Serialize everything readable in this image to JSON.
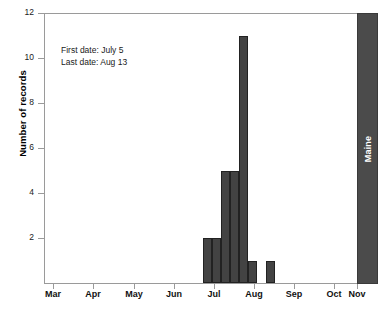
{
  "chart_data": {
    "type": "bar",
    "title": "",
    "subtitle": "",
    "xlabel": "",
    "ylabel": "Number of records",
    "ylim": [
      0,
      12
    ],
    "yticks": [
      2,
      4,
      6,
      8,
      10,
      12
    ],
    "ytick_labels": [
      "2",
      "4",
      "6",
      "8",
      "10",
      "12"
    ],
    "xtick_labels": [
      "Mar",
      "Apr",
      "May",
      "Jun",
      "Jul",
      "Aug",
      "Sep",
      "Oct",
      "Nov"
    ],
    "xtick_positions_px": [
      53,
      93,
      134,
      174,
      214,
      254,
      294,
      334,
      357
    ],
    "grid": false,
    "legend": null,
    "panel_label": "Maine",
    "bar_color": "#434343",
    "axis_color": "#9a9a9a",
    "categories": [
      "Jul 1",
      "Jul 7",
      "Jul 13",
      "Jul 19",
      "Jul 25",
      "Aug 1",
      "Aug 7",
      "Aug 13"
    ],
    "values": [
      2,
      2,
      5,
      5,
      11,
      1,
      0,
      1
    ],
    "bars": [
      {
        "label": "Jul 1",
        "value": 2,
        "left_px": 158,
        "width_px": 9
      },
      {
        "label": "Jul 7",
        "value": 2,
        "left_px": 167,
        "width_px": 9
      },
      {
        "label": "Jul 13",
        "value": 5,
        "left_px": 176,
        "width_px": 9
      },
      {
        "label": "Jul 19",
        "value": 5,
        "left_px": 185,
        "width_px": 9
      },
      {
        "label": "Jul 25",
        "value": 11,
        "left_px": 194,
        "width_px": 9
      },
      {
        "label": "Aug 1",
        "value": 1,
        "left_px": 203,
        "width_px": 9
      },
      {
        "label": "Aug 13",
        "value": 1,
        "left_px": 221,
        "width_px": 9
      }
    ],
    "annotations": [
      "First date: July 5",
      "Last date: Aug 13"
    ]
  },
  "annotation": {
    "first_date_line": "First date: July 5",
    "last_date_line": "Last date: Aug 13"
  },
  "axes": {
    "y_title": "Number of records",
    "y_labels": [
      "12",
      "10",
      "8",
      "6",
      "4",
      "2"
    ],
    "x_labels": [
      "Mar",
      "Apr",
      "May",
      "Jun",
      "Jul",
      "Aug",
      "Sep",
      "Oct",
      "Nov"
    ]
  },
  "panel": {
    "strip_label": "Maine"
  }
}
